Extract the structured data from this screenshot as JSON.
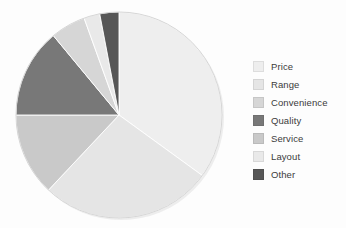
{
  "background_color": "#fdfdfd",
  "legend": {
    "position": "right",
    "text_color": "#3b3b3b",
    "items": [
      {
        "label": "Price",
        "color": "#eeeeee"
      },
      {
        "label": "Range",
        "color": "#e5e5e5"
      },
      {
        "label": "Convenience",
        "color": "#d6d6d6"
      },
      {
        "label": "Quality",
        "color": "#787878"
      },
      {
        "label": "Service",
        "color": "#c9c9c9"
      },
      {
        "label": "Layout",
        "color": "#e9e9e9"
      },
      {
        "label": "Other",
        "color": "#575757"
      }
    ]
  },
  "chart_data": {
    "type": "pie",
    "title": "",
    "subtitle": "",
    "xlabel": "",
    "ylabel": "",
    "grid": false,
    "legend_position": "right",
    "start_angle_deg": 0,
    "direction": "clockwise",
    "center": {
      "x": 111,
      "y": 111
    },
    "radius": 103,
    "categories": [
      "Price",
      "Range",
      "Convenience",
      "Quality",
      "Service",
      "Layout",
      "Other"
    ],
    "values": [
      35,
      27,
      5.5,
      14,
      13,
      2.5,
      8
    ],
    "unit": "%",
    "slices": [
      {
        "label": "Price",
        "value": 35,
        "color": "#eeeeee",
        "start_deg": 0,
        "end_deg": 126
      },
      {
        "label": "Range",
        "value": 27,
        "color": "#e5e5e5",
        "start_deg": 126,
        "end_deg": 223.2
      },
      {
        "label": "Service",
        "value": 13,
        "color": "#c9c9c9",
        "start_deg": 223.2,
        "end_deg": 270
      },
      {
        "label": "Quality",
        "value": 14,
        "color": "#787878",
        "start_deg": 270,
        "end_deg": 320.4
      },
      {
        "label": "Convenience",
        "value": 5.5,
        "color": "#d6d6d6",
        "start_deg": 320.4,
        "end_deg": 340.2
      },
      {
        "label": "Layout",
        "value": 2.5,
        "color": "#e9e9e9",
        "start_deg": 340.2,
        "end_deg": 349.2
      },
      {
        "label": "Other",
        "value": 8,
        "color": "#575757",
        "start_deg": 349.2,
        "end_deg": 360
      }
    ]
  }
}
